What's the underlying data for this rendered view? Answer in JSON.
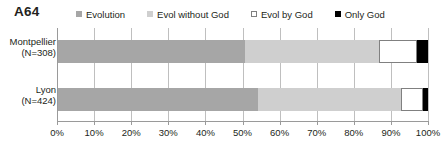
{
  "chart_data": {
    "type": "bar",
    "title": "A64",
    "subtype": "stacked-horizontal-100percent",
    "xlabel": "",
    "ylabel": "",
    "categories": [
      "Montpellier\n(N=308)",
      "Lyon\n(N=424)"
    ],
    "category_labels": [
      {
        "name": "Montpellier",
        "n": "(N=308)"
      },
      {
        "name": "Lyon",
        "n": "(N=424)"
      }
    ],
    "series": [
      {
        "name": "Evolution",
        "color": "#a6a6a6",
        "values": [
          50.7,
          54.2
        ]
      },
      {
        "name": "Evol without God",
        "color": "#cfcfcf",
        "values": [
          36.1,
          38.6
        ]
      },
      {
        "name": "Evol by God",
        "color": "#ffffff",
        "values": [
          10.2,
          5.9
        ]
      },
      {
        "name": "Only God",
        "color": "#000000",
        "values": [
          3.0,
          1.3
        ]
      }
    ],
    "xlim": [
      0,
      100
    ],
    "xticks": [
      0,
      10,
      20,
      30,
      40,
      50,
      60,
      70,
      80,
      90,
      100
    ],
    "xtick_labels": [
      "0%",
      "10%",
      "20%",
      "30%",
      "40%",
      "50%",
      "60%",
      "70%",
      "80%",
      "90%",
      "100%"
    ],
    "grid": true,
    "legend_position": "top"
  },
  "legend": {
    "items": [
      {
        "label": "Evolution",
        "swatch": "#a6a6a6",
        "border": "#a6a6a6"
      },
      {
        "label": "Evol without God",
        "swatch": "#cfcfcf",
        "border": "#cfcfcf"
      },
      {
        "label": "Evol by God",
        "swatch": "#ffffff",
        "border": "#7f7f7f"
      },
      {
        "label": "Only God",
        "swatch": "#000000",
        "border": "#000000"
      }
    ]
  }
}
